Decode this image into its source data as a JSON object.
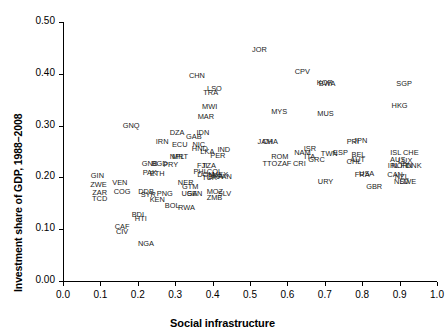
{
  "chart_data": {
    "type": "scatter",
    "title": "",
    "xlabel": "Social infrastructure",
    "ylabel": "Investment share of GDP, 1988–2008",
    "xlim": [
      0.0,
      1.0
    ],
    "ylim": [
      0.0,
      0.5
    ],
    "xticks": [
      "0.0",
      "0.1",
      "0.2",
      "0.3",
      "0.4",
      "0.5",
      "0.6",
      "0.7",
      "0.8",
      "0.9",
      "1.0"
    ],
    "yticks": [
      "0.00",
      "0.10",
      "0.20",
      "0.30",
      "0.40",
      "0.50"
    ],
    "grid": false,
    "legend": "none",
    "marker_style": "text-label",
    "points": [
      {
        "label": "JOR",
        "x": 0.525,
        "y": 0.446
      },
      {
        "label": "CHN",
        "x": 0.358,
        "y": 0.396
      },
      {
        "label": "CPV",
        "x": 0.64,
        "y": 0.404
      },
      {
        "label": "KOR",
        "x": 0.7,
        "y": 0.383
      },
      {
        "label": "BWA",
        "x": 0.706,
        "y": 0.381
      },
      {
        "label": "SGP",
        "x": 0.912,
        "y": 0.38
      },
      {
        "label": "LSO",
        "x": 0.405,
        "y": 0.37
      },
      {
        "label": "TRA",
        "x": 0.395,
        "y": 0.362
      },
      {
        "label": "MWI",
        "x": 0.392,
        "y": 0.336
      },
      {
        "label": "HKG",
        "x": 0.9,
        "y": 0.337
      },
      {
        "label": "MYS",
        "x": 0.578,
        "y": 0.327
      },
      {
        "label": "MUS",
        "x": 0.702,
        "y": 0.322
      },
      {
        "label": "MAR",
        "x": 0.382,
        "y": 0.316
      },
      {
        "label": "GNQ",
        "x": 0.182,
        "y": 0.3
      },
      {
        "label": "DZA",
        "x": 0.305,
        "y": 0.286
      },
      {
        "label": "IDN",
        "x": 0.374,
        "y": 0.285
      },
      {
        "label": "GAB",
        "x": 0.35,
        "y": 0.278
      },
      {
        "label": "IRN",
        "x": 0.265,
        "y": 0.268
      },
      {
        "label": "ECU",
        "x": 0.312,
        "y": 0.262
      },
      {
        "label": "NIC",
        "x": 0.363,
        "y": 0.263
      },
      {
        "label": "JAM",
        "x": 0.54,
        "y": 0.268
      },
      {
        "label": "CHA",
        "x": 0.554,
        "y": 0.268
      },
      {
        "label": "PRI",
        "x": 0.775,
        "y": 0.268
      },
      {
        "label": "JPN",
        "x": 0.795,
        "y": 0.27
      },
      {
        "label": "HND",
        "x": 0.366,
        "y": 0.254
      },
      {
        "label": "LKA",
        "x": 0.386,
        "y": 0.25
      },
      {
        "label": "IND",
        "x": 0.43,
        "y": 0.252
      },
      {
        "label": "ISR",
        "x": 0.66,
        "y": 0.254
      },
      {
        "label": "ESP",
        "x": 0.742,
        "y": 0.248
      },
      {
        "label": "TWN",
        "x": 0.712,
        "y": 0.245
      },
      {
        "label": "NAM",
        "x": 0.64,
        "y": 0.247
      },
      {
        "label": "ITA",
        "x": 0.66,
        "y": 0.24
      },
      {
        "label": "BEL",
        "x": 0.79,
        "y": 0.243
      },
      {
        "label": "ISL",
        "x": 0.89,
        "y": 0.247
      },
      {
        "label": "CHE",
        "x": 0.93,
        "y": 0.248
      },
      {
        "label": "NPL",
        "x": 0.305,
        "y": 0.24
      },
      {
        "label": "MRT",
        "x": 0.313,
        "y": 0.239
      },
      {
        "label": "PER",
        "x": 0.414,
        "y": 0.242
      },
      {
        "label": "ROM",
        "x": 0.58,
        "y": 0.24
      },
      {
        "label": "GRC",
        "x": 0.678,
        "y": 0.234
      },
      {
        "label": "AUT",
        "x": 0.788,
        "y": 0.234
      },
      {
        "label": "CHL",
        "x": 0.778,
        "y": 0.23
      },
      {
        "label": "AUS",
        "x": 0.895,
        "y": 0.234
      },
      {
        "label": "LUX",
        "x": 0.915,
        "y": 0.232
      },
      {
        "label": "GNB",
        "x": 0.232,
        "y": 0.226
      },
      {
        "label": "BGD",
        "x": 0.258,
        "y": 0.226
      },
      {
        "label": "PRY",
        "x": 0.288,
        "y": 0.224
      },
      {
        "label": "FJI",
        "x": 0.372,
        "y": 0.222
      },
      {
        "label": "TZA",
        "x": 0.39,
        "y": 0.222
      },
      {
        "label": "TTO",
        "x": 0.553,
        "y": 0.225
      },
      {
        "label": "ZAF",
        "x": 0.592,
        "y": 0.226
      },
      {
        "label": "CRI",
        "x": 0.632,
        "y": 0.226
      },
      {
        "label": "IRL",
        "x": 0.884,
        "y": 0.222
      },
      {
        "label": "NOR",
        "x": 0.9,
        "y": 0.222
      },
      {
        "label": "FIN",
        "x": 0.918,
        "y": 0.222
      },
      {
        "label": "DNK",
        "x": 0.938,
        "y": 0.222
      },
      {
        "label": "PAK",
        "x": 0.232,
        "y": 0.208
      },
      {
        "label": "ETH",
        "x": 0.252,
        "y": 0.206
      },
      {
        "label": "GIN",
        "x": 0.092,
        "y": 0.203
      },
      {
        "label": "PHL",
        "x": 0.368,
        "y": 0.21
      },
      {
        "label": "COL",
        "x": 0.405,
        "y": 0.21
      },
      {
        "label": "DOM",
        "x": 0.382,
        "y": 0.204
      },
      {
        "label": "MEX",
        "x": 0.42,
        "y": 0.205
      },
      {
        "label": "TUR",
        "x": 0.392,
        "y": 0.198
      },
      {
        "label": "BRA",
        "x": 0.408,
        "y": 0.2
      },
      {
        "label": "PAN",
        "x": 0.432,
        "y": 0.2
      },
      {
        "label": "FRA",
        "x": 0.8,
        "y": 0.205
      },
      {
        "label": "USA",
        "x": 0.812,
        "y": 0.206
      },
      {
        "label": "CAN",
        "x": 0.888,
        "y": 0.205
      },
      {
        "label": "NZL",
        "x": 0.906,
        "y": 0.2
      },
      {
        "label": "VEN",
        "x": 0.152,
        "y": 0.19
      },
      {
        "label": "ZWE",
        "x": 0.095,
        "y": 0.185
      },
      {
        "label": "NER",
        "x": 0.328,
        "y": 0.19
      },
      {
        "label": "GTM",
        "x": 0.34,
        "y": 0.182
      },
      {
        "label": "URY",
        "x": 0.702,
        "y": 0.192
      },
      {
        "label": "NLD",
        "x": 0.905,
        "y": 0.191
      },
      {
        "label": "SWE",
        "x": 0.922,
        "y": 0.191
      },
      {
        "label": "GBR",
        "x": 0.832,
        "y": 0.182
      },
      {
        "label": "COG",
        "x": 0.158,
        "y": 0.172
      },
      {
        "label": "ZAR",
        "x": 0.098,
        "y": 0.17
      },
      {
        "label": "DDB",
        "x": 0.222,
        "y": 0.172
      },
      {
        "label": "SYR",
        "x": 0.228,
        "y": 0.166
      },
      {
        "label": "PNG",
        "x": 0.272,
        "y": 0.168
      },
      {
        "label": "UGA",
        "x": 0.338,
        "y": 0.168
      },
      {
        "label": "SEN",
        "x": 0.352,
        "y": 0.168
      },
      {
        "label": "MOZ",
        "x": 0.406,
        "y": 0.172
      },
      {
        "label": "SLV",
        "x": 0.432,
        "y": 0.168
      },
      {
        "label": "ZMB",
        "x": 0.405,
        "y": 0.16
      },
      {
        "label": "TCD",
        "x": 0.098,
        "y": 0.158
      },
      {
        "label": "KEN",
        "x": 0.252,
        "y": 0.156
      },
      {
        "label": "BOL",
        "x": 0.292,
        "y": 0.144
      },
      {
        "label": "RWA",
        "x": 0.33,
        "y": 0.14
      },
      {
        "label": "BDI",
        "x": 0.2,
        "y": 0.128
      },
      {
        "label": "HTI",
        "x": 0.208,
        "y": 0.12
      },
      {
        "label": "CAF",
        "x": 0.158,
        "y": 0.104
      },
      {
        "label": "CIV",
        "x": 0.158,
        "y": 0.094
      },
      {
        "label": "NGA",
        "x": 0.222,
        "y": 0.072
      }
    ]
  }
}
